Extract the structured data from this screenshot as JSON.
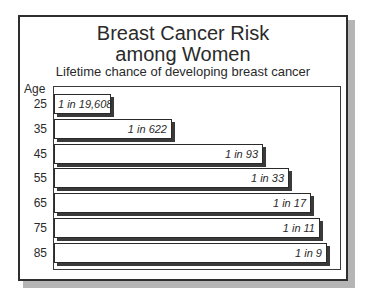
{
  "chart_data": {
    "type": "bar",
    "orientation": "horizontal",
    "title_lines": [
      "Breast Cancer Risk",
      "among Women"
    ],
    "subtitle": "Lifetime chance of developing breast cancer",
    "ylabel": "Age",
    "xlabel": "",
    "categories": [
      "25",
      "35",
      "45",
      "55",
      "65",
      "75",
      "85"
    ],
    "labels": [
      "1 in 19,608",
      "1 in 622",
      "1 in 93",
      "1 in 33",
      "1 in 17",
      "1 in 11",
      "1 in 9"
    ],
    "values": [
      19608,
      622,
      93,
      33,
      17,
      11,
      9
    ],
    "risk_fraction": [
      5.1e-05,
      0.0016,
      0.0108,
      0.0303,
      0.0588,
      0.0909,
      0.1111
    ],
    "bar_length_px": [
      57,
      118,
      209,
      235,
      257,
      266,
      273
    ],
    "grid": false,
    "legend": null
  },
  "header": {
    "title_line1": "Breast Cancer Risk",
    "title_line2": "among Women",
    "subtitle": "Lifetime chance of developing breast cancer"
  },
  "axis": {
    "age_label": "Age"
  },
  "rows": [
    {
      "age": "25",
      "label": "1 in 19,608"
    },
    {
      "age": "35",
      "label": "1 in 622"
    },
    {
      "age": "45",
      "label": "1 in 93"
    },
    {
      "age": "55",
      "label": "1 in 33"
    },
    {
      "age": "65",
      "label": "1 in 17"
    },
    {
      "age": "75",
      "label": "1 in 11"
    },
    {
      "age": "85",
      "label": "1 in 9"
    }
  ],
  "colors": {
    "frame_border": "#2e2e2e",
    "frame_shadow": "#b5b5b5",
    "bar_fill": "#ffffff",
    "bar_border": "#2a2a2a",
    "bar_shadow": "#3a3a3a",
    "text": "#2a2a2a"
  }
}
